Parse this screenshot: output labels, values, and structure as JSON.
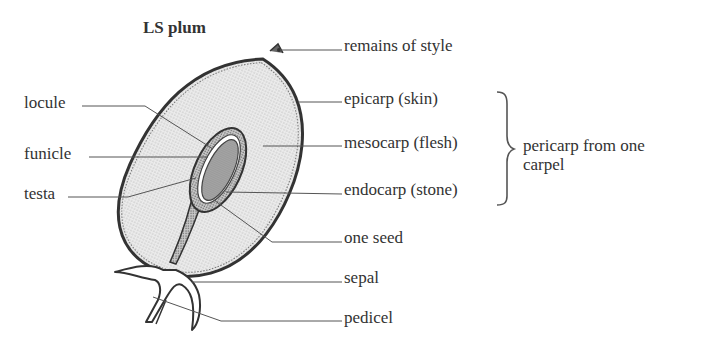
{
  "figure": {
    "title": "LS plum",
    "left_labels": [
      {
        "id": "locule",
        "text": "locule"
      },
      {
        "id": "funicle",
        "text": "funicle"
      },
      {
        "id": "testa",
        "text": "testa"
      }
    ],
    "right_labels": [
      {
        "id": "remains-of-style",
        "text": "remains of style"
      },
      {
        "id": "epicarp",
        "text": "epicarp (skin)"
      },
      {
        "id": "mesocarp",
        "text": "mesocarp (flesh)"
      },
      {
        "id": "endocarp",
        "text": "endocarp (stone)"
      },
      {
        "id": "one-seed",
        "text": "one seed"
      },
      {
        "id": "sepal",
        "text": "sepal"
      },
      {
        "id": "pedicel",
        "text": "pedicel"
      }
    ],
    "bracket_label": {
      "line1": "pericarp from one",
      "line2": "carpel"
    },
    "colors": {
      "outline": "#3a3a3a",
      "flesh": "#e4e4e4",
      "stone": "#b8b8b8",
      "seed": "#a0a0a0",
      "leader": "#555555"
    }
  }
}
